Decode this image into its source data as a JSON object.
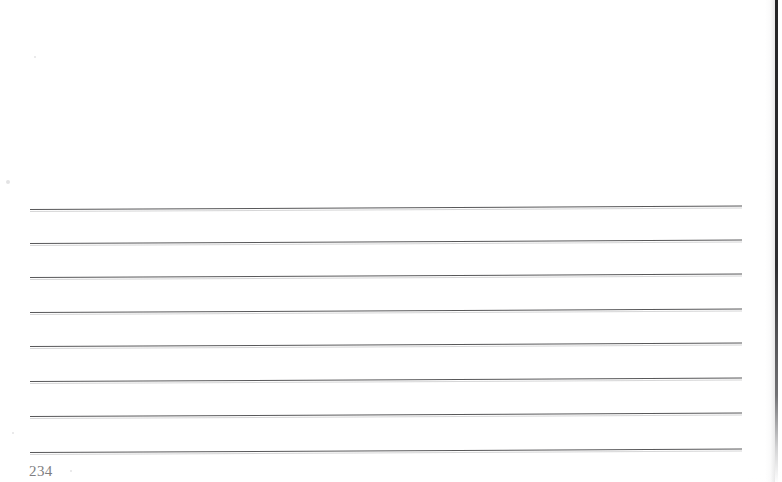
{
  "document": {
    "kind": "scanned-book-page",
    "page_number": "234",
    "background_color": "#ffffff",
    "ink_color": "#4a4a4c",
    "folio_color": "#6d6d70",
    "edge_shadow_color": "#1a1a1c",
    "content_text": ""
  },
  "page_edge": {
    "label": "page-edge-shadow",
    "x": 776
  },
  "rules": {
    "label": "ruled-lines",
    "count": 8,
    "left_x": 30,
    "right_x": 742,
    "skew_degrees": -0.28,
    "lines": [
      {
        "id": "rule-1",
        "y": 209
      },
      {
        "id": "rule-2",
        "y": 243
      },
      {
        "id": "rule-3",
        "y": 277
      },
      {
        "id": "rule-4",
        "y": 312
      },
      {
        "id": "rule-5",
        "y": 346
      },
      {
        "id": "rule-6",
        "y": 381
      },
      {
        "id": "rule-7",
        "y": 416
      },
      {
        "id": "rule-8",
        "y": 452
      }
    ]
  },
  "specks": [
    {
      "x": 6,
      "y": 180,
      "r": 2
    },
    {
      "x": 34,
      "y": 56,
      "r": 1
    },
    {
      "x": 12,
      "y": 432,
      "r": 1
    },
    {
      "x": 70,
      "y": 470,
      "r": 1
    }
  ]
}
